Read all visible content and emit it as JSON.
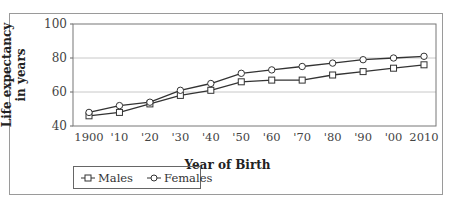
{
  "chart_data": {
    "type": "line",
    "title": "",
    "xlabel": "Year of Birth",
    "ylabel": "Life expectancy in years",
    "ylabel_lines": [
      "Life expectancy",
      "in years"
    ],
    "categories": [
      "1900",
      "'10",
      "'20",
      "'30",
      "'40",
      "'50",
      "'60",
      "'70",
      "'80",
      "'90",
      "'00",
      "2010"
    ],
    "x": [
      1900,
      1910,
      1920,
      1930,
      1940,
      1950,
      1960,
      1970,
      1980,
      1990,
      2000,
      2010
    ],
    "yticks": [
      40,
      60,
      80,
      100
    ],
    "ylim": [
      40,
      100
    ],
    "grid": true,
    "legend_position": "bottom-left",
    "series": [
      {
        "name": "Males",
        "marker": "square",
        "color": "#333333",
        "values": [
          46,
          48,
          53,
          58,
          61,
          66,
          67,
          67,
          70,
          72,
          74,
          76
        ]
      },
      {
        "name": "Females",
        "marker": "circle",
        "color": "#333333",
        "values": [
          48,
          52,
          54,
          61,
          65,
          71,
          73,
          75,
          77,
          79,
          80,
          81
        ]
      }
    ]
  },
  "legend": {
    "males": "Males",
    "females": "Females"
  }
}
